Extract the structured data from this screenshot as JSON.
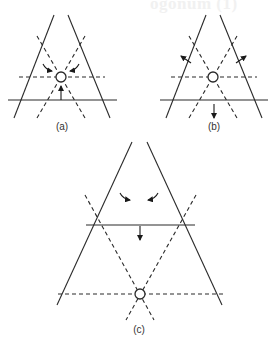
{
  "page": {
    "bleed_through_text": "ogonum (1) "
  },
  "figures": [
    {
      "id": "a",
      "label": "(a)",
      "arrows": "inward",
      "description": "Triangle with inscribed dashed grid; arrows pointing toward central node"
    },
    {
      "id": "b",
      "label": "(b)",
      "arrows": "outward",
      "description": "Triangle with inscribed dashed grid; arrows pointing away from central node"
    },
    {
      "id": "c",
      "label": "(c)",
      "arrows": "inward-down",
      "description": "Larger triangle; central node at dashed base, arrows converging and moving down"
    }
  ],
  "colors": {
    "line": "#2a2a2a",
    "background": "#ffffff"
  }
}
